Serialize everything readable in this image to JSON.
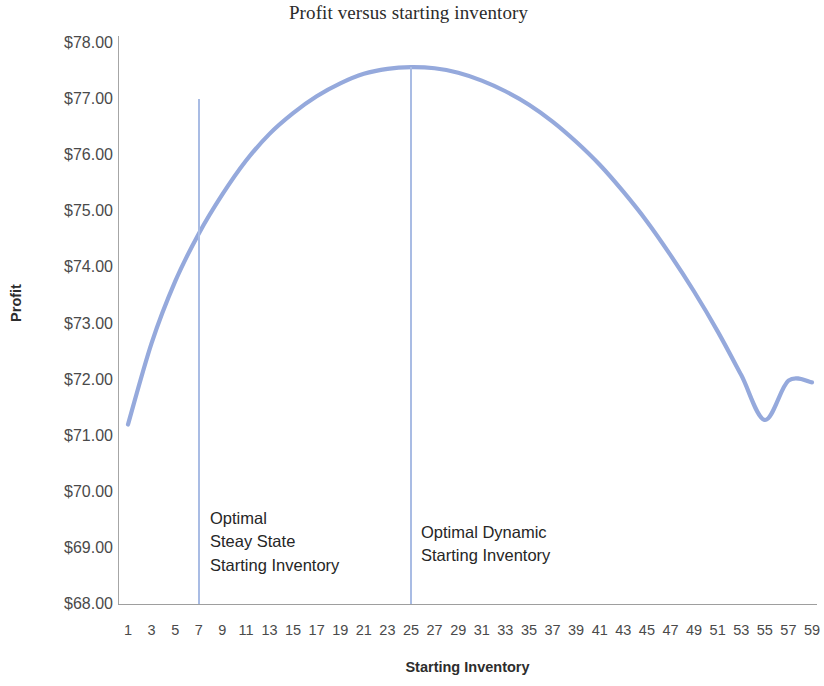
{
  "chart_data": {
    "type": "line",
    "title": "Profit versus starting inventory",
    "xlabel": "Starting Inventory",
    "ylabel": "Profit",
    "xlim": [
      1,
      59
    ],
    "ylim": [
      68,
      78
    ],
    "grid": false,
    "legend": null,
    "line_color": "#95a9dc",
    "x_tick_labels": [
      "1",
      "3",
      "5",
      "7",
      "9",
      "11",
      "13",
      "15",
      "17",
      "19",
      "21",
      "23",
      "25",
      "27",
      "29",
      "31",
      "33",
      "35",
      "37",
      "39",
      "41",
      "43",
      "45",
      "47",
      "49",
      "51",
      "53",
      "55",
      "57",
      "59"
    ],
    "y_tick_labels": [
      "$78.00",
      "$77.00",
      "$76.00",
      "$75.00",
      "$74.00",
      "$73.00",
      "$72.00",
      "$71.00",
      "$70.00",
      "$69.00",
      "$68.00"
    ],
    "y_tick_values": [
      78,
      77,
      76,
      75,
      74,
      73,
      72,
      71,
      70,
      69,
      68
    ],
    "x": [
      1,
      3,
      5,
      7,
      9,
      11,
      13,
      15,
      17,
      19,
      21,
      23,
      25,
      27,
      29,
      31,
      33,
      35,
      37,
      39,
      41,
      43,
      45,
      47,
      49,
      51,
      53,
      55,
      57,
      59
    ],
    "values": [
      71.2,
      72.65,
      73.75,
      74.6,
      75.3,
      75.9,
      76.38,
      76.75,
      77.05,
      77.28,
      77.45,
      77.54,
      77.57,
      77.55,
      77.47,
      77.33,
      77.14,
      76.9,
      76.6,
      76.24,
      75.83,
      75.35,
      74.82,
      74.22,
      73.57,
      72.86,
      72.08,
      71.28,
      71.98,
      71.95
    ],
    "annotations": [
      {
        "name": "optimal-steady-state",
        "text": "Optimal\nSteay State\nStarting Inventory",
        "marker_x": 7,
        "marker_top_value": 77.0,
        "marker_bottom_value": 68.0
      },
      {
        "name": "optimal-dynamic",
        "text": "Optimal Dynamic\nStarting Inventory",
        "marker_x": 25,
        "marker_top_value": 77.57,
        "marker_bottom_value": 68.0
      }
    ]
  }
}
